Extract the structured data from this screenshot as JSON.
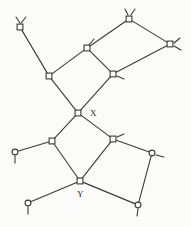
{
  "figure": {
    "width": 191,
    "height": 227,
    "background_color": "#fbfbf9",
    "line_color": "#3a3a3a",
    "node_fill_color": "#ffffff",
    "node_stroke_color": "#3a3a3a",
    "line_width": 1.1
  },
  "labels": [
    {
      "id": "label-x",
      "text": "X",
      "x": 90,
      "y": 109
    },
    {
      "id": "label-y",
      "text": "Y",
      "x": 77,
      "y": 190
    }
  ],
  "nodes": [
    {
      "id": "n1",
      "shape": "square",
      "x": 20,
      "y": 27,
      "name": "node-top-left"
    },
    {
      "id": "n2",
      "shape": "square",
      "x": 49,
      "y": 76,
      "name": "node-upper-left-ring"
    },
    {
      "id": "n3",
      "shape": "square",
      "x": 87,
      "y": 48,
      "name": "node-upper-ring-top"
    },
    {
      "id": "n4",
      "shape": "square",
      "x": 113,
      "y": 74,
      "name": "node-upper-ring-right"
    },
    {
      "id": "n5",
      "shape": "square",
      "x": 129,
      "y": 19,
      "name": "node-top-center"
    },
    {
      "id": "n6",
      "shape": "square",
      "x": 170,
      "y": 44,
      "name": "node-top-right"
    },
    {
      "id": "n7",
      "shape": "square",
      "x": 78,
      "y": 113,
      "name": "node-x-center"
    },
    {
      "id": "n8",
      "shape": "square",
      "x": 52,
      "y": 141,
      "name": "node-lower-left-ring"
    },
    {
      "id": "n9",
      "shape": "square",
      "x": 113,
      "y": 139,
      "name": "node-lower-right-ring"
    },
    {
      "id": "n10",
      "shape": "square",
      "x": 80,
      "y": 181,
      "name": "node-y-center"
    },
    {
      "id": "n11",
      "shape": "circle",
      "x": 15,
      "y": 152,
      "name": "node-left-terminal"
    },
    {
      "id": "n12",
      "shape": "circle",
      "x": 152,
      "y": 153,
      "name": "node-right-terminal"
    },
    {
      "id": "n13",
      "shape": "circle",
      "x": 28,
      "y": 203,
      "name": "node-bottom-left-terminal"
    },
    {
      "id": "n14",
      "shape": "circle",
      "x": 138,
      "y": 205,
      "name": "node-bottom-right-terminal"
    }
  ],
  "edges": [
    {
      "from": "n1",
      "to": "n2",
      "name": "edge-n1-n2"
    },
    {
      "from": "n2",
      "to": "n3",
      "name": "edge-n2-n3"
    },
    {
      "from": "n3",
      "to": "n4",
      "name": "edge-n3-n4"
    },
    {
      "from": "n3",
      "to": "n5",
      "name": "edge-n3-n5"
    },
    {
      "from": "n5",
      "to": "n6",
      "name": "edge-n5-n6"
    },
    {
      "from": "n6",
      "to": "n4",
      "name": "edge-n6-n4"
    },
    {
      "from": "n2",
      "to": "n7",
      "name": "edge-n2-n7"
    },
    {
      "from": "n4",
      "to": "n7",
      "name": "edge-n4-n7"
    },
    {
      "from": "n7",
      "to": "n8",
      "name": "edge-n7-n8"
    },
    {
      "from": "n7",
      "to": "n9",
      "name": "edge-n7-n9"
    },
    {
      "from": "n8",
      "to": "n10",
      "name": "edge-n8-n10"
    },
    {
      "from": "n9",
      "to": "n10",
      "name": "edge-n9-n10"
    },
    {
      "from": "n8",
      "to": "n11",
      "name": "edge-n8-n11"
    },
    {
      "from": "n9",
      "to": "n12",
      "name": "edge-n9-n12"
    },
    {
      "from": "n10",
      "to": "n13",
      "name": "edge-n10-n13"
    },
    {
      "from": "n10",
      "to": "n14",
      "name": "edge-n10-n14"
    },
    {
      "from": "n12",
      "to": "n14",
      "name": "edge-n12-n14"
    }
  ],
  "stubs": [
    {
      "node": "n1",
      "x1": 16,
      "y1": 17,
      "x2": 20,
      "y2": 23,
      "name": "stub-n1-a"
    },
    {
      "node": "n1",
      "x1": 26,
      "y1": 17,
      "x2": 21,
      "y2": 23,
      "name": "stub-n1-b"
    },
    {
      "node": "n5",
      "x1": 125,
      "y1": 9,
      "x2": 128,
      "y2": 15,
      "name": "stub-n5-a"
    },
    {
      "node": "n5",
      "x1": 135,
      "y1": 9,
      "x2": 131,
      "y2": 15,
      "name": "stub-n5-b"
    },
    {
      "node": "n6",
      "x1": 180,
      "y1": 38,
      "x2": 174,
      "y2": 43,
      "name": "stub-n6-a"
    },
    {
      "node": "n6",
      "x1": 181,
      "y1": 50,
      "x2": 174,
      "y2": 46,
      "name": "stub-n6-b"
    },
    {
      "node": "n3",
      "x1": 94,
      "y1": 39,
      "x2": 89,
      "y2": 45,
      "name": "stub-n3-a"
    },
    {
      "node": "n4",
      "x1": 124,
      "y1": 79,
      "x2": 117,
      "y2": 76,
      "name": "stub-n4-a"
    },
    {
      "node": "n9",
      "x1": 124,
      "y1": 134,
      "x2": 117,
      "y2": 137,
      "name": "stub-n9-a"
    },
    {
      "node": "n11",
      "x1": 15,
      "y1": 156,
      "x2": 15,
      "y2": 163,
      "name": "stub-n11-a"
    },
    {
      "node": "n12",
      "x1": 156,
      "y1": 155,
      "x2": 164,
      "y2": 157,
      "name": "stub-n12-a"
    },
    {
      "node": "n13",
      "x1": 28,
      "y1": 207,
      "x2": 28,
      "y2": 214,
      "name": "stub-n13-a"
    },
    {
      "node": "n14",
      "x1": 138,
      "y1": 209,
      "x2": 137,
      "y2": 216,
      "name": "stub-n14-a"
    }
  ]
}
